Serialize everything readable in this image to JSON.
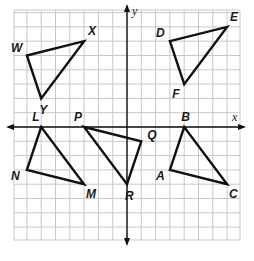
{
  "diagram": {
    "type": "coordinate-plane",
    "grid": {
      "xmin": -8,
      "xmax": 8,
      "ymin": -8,
      "ymax": 8,
      "cell_px": 14.3,
      "origin_px": [
        127,
        127
      ],
      "grid_color": "#c8c8c8",
      "line_color": "#111111"
    },
    "axes": {
      "x_label": "x",
      "y_label": "y"
    },
    "triangles": [
      {
        "name": "WXY",
        "vertices": [
          {
            "label": "W",
            "x": -7,
            "y": 5,
            "lx": -16,
            "ly": -4
          },
          {
            "label": "X",
            "x": -3,
            "y": 6,
            "lx": 4,
            "ly": -6
          },
          {
            "label": "Y",
            "x": -6,
            "y": 2,
            "lx": -2,
            "ly": 16
          }
        ]
      },
      {
        "name": "DEF",
        "vertices": [
          {
            "label": "D",
            "x": 3,
            "y": 6,
            "lx": -14,
            "ly": -4
          },
          {
            "label": "E",
            "x": 7,
            "y": 7,
            "lx": 3,
            "ly": -6
          },
          {
            "label": "F",
            "x": 4,
            "y": 3,
            "lx": -12,
            "ly": 14
          }
        ]
      },
      {
        "name": "LNM",
        "vertices": [
          {
            "label": "L",
            "x": -6,
            "y": 0,
            "lx": -9,
            "ly": -6
          },
          {
            "label": "N",
            "x": -7,
            "y": -3,
            "lx": -16,
            "ly": 10
          },
          {
            "label": "M",
            "x": -3,
            "y": -4,
            "lx": 2,
            "ly": 14
          }
        ]
      },
      {
        "name": "PQR",
        "vertices": [
          {
            "label": "P",
            "x": -3,
            "y": 0,
            "lx": -10,
            "ly": -6
          },
          {
            "label": "Q",
            "x": 1,
            "y": -1,
            "lx": 6,
            "ly": -2
          },
          {
            "label": "R",
            "x": 0,
            "y": -4,
            "lx": -2,
            "ly": 16
          }
        ]
      },
      {
        "name": "BAC",
        "vertices": [
          {
            "label": "B",
            "x": 4,
            "y": 0,
            "lx": -3,
            "ly": -6
          },
          {
            "label": "A",
            "x": 3,
            "y": -3,
            "lx": -14,
            "ly": 10
          },
          {
            "label": "C",
            "x": 7,
            "y": -4,
            "lx": 2,
            "ly": 14
          }
        ]
      }
    ]
  }
}
